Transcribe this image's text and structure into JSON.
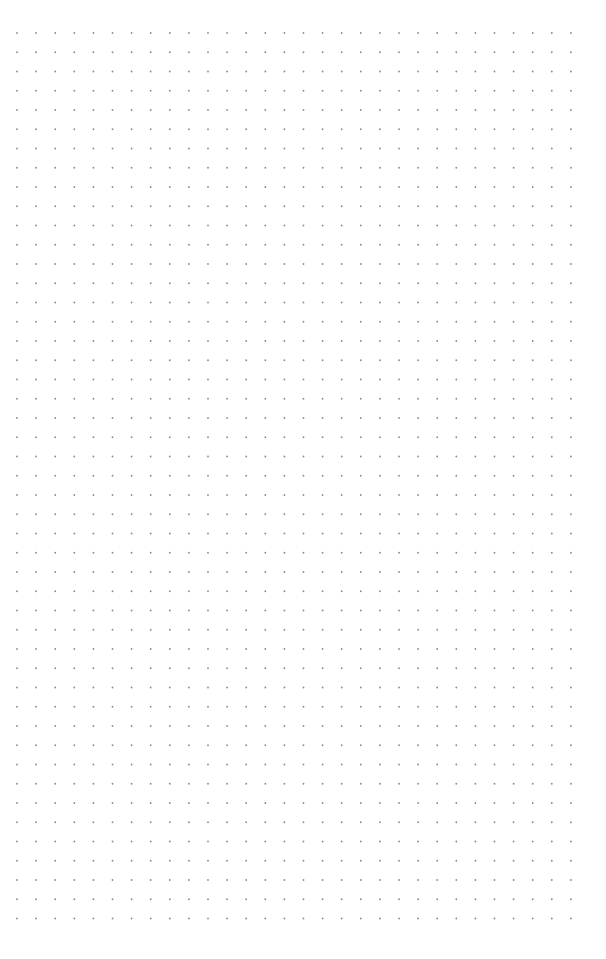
{
  "page": {
    "background": "#ffffff",
    "pattern": "dot-grid"
  },
  "grid": {
    "columns": 30,
    "rows": 47,
    "origin_x": 17,
    "origin_y": 33,
    "step_x": 19.1,
    "step_y": 19.25,
    "dot_radius": 0.9,
    "dot_color": "#8a8a8a"
  }
}
